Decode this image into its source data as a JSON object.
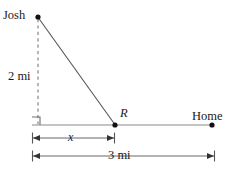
{
  "figure": {
    "kind": "right-triangle-distance-diagram",
    "labels": {
      "josh": "Josh",
      "vertical_distance": "2 mi",
      "point_r": "R",
      "home": "Home",
      "segment_x": "x",
      "total_distance": "3 mi"
    },
    "colors": {
      "line": "#6e6e6e",
      "dashed": "#7a7a7a",
      "point": "#111111",
      "text": "#1a1a1a",
      "dimension": "#555555",
      "background": "#ffffff"
    },
    "geometry": {
      "josh_point": [
        38,
        17
      ],
      "foot_point": [
        32,
        125
      ],
      "r_point": [
        115,
        125
      ],
      "home_point": [
        212,
        125
      ],
      "vertical_leg_label": "2 mi",
      "horizontal_segment_label": "x",
      "full_baseline_label": "3 mi"
    },
    "dimensions": {
      "x_line_y": 138,
      "x_line_start": 32,
      "x_line_end": 115,
      "total_line_y": 156,
      "total_line_start": 32,
      "total_line_end": 215
    }
  }
}
